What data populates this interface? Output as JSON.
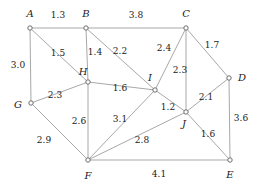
{
  "figure": {
    "type": "weighted-undirected-graph",
    "background_color": "#ffffff",
    "edge_color": "#a8a8a8",
    "node_stroke_color": "#6e6e6e",
    "node_fill_color": "#ffffff",
    "label_color": "#1a1a1a",
    "width": 259,
    "height": 191
  },
  "nodes": [
    {
      "id": "A",
      "label": "A",
      "x": 30,
      "y": 28,
      "label_x": 30,
      "label_y": 14
    },
    {
      "id": "B",
      "label": "B",
      "x": 86,
      "y": 28,
      "label_x": 86,
      "label_y": 14
    },
    {
      "id": "C",
      "label": "C",
      "x": 186,
      "y": 28,
      "label_x": 186,
      "label_y": 14
    },
    {
      "id": "D",
      "label": "D",
      "x": 229,
      "y": 78,
      "label_x": 242,
      "label_y": 78
    },
    {
      "id": "E",
      "label": "E",
      "x": 230,
      "y": 160,
      "label_x": 230,
      "label_y": 175
    },
    {
      "id": "F",
      "label": "F",
      "x": 88,
      "y": 160,
      "label_x": 88,
      "label_y": 176
    },
    {
      "id": "G",
      "label": "G",
      "x": 31,
      "y": 103,
      "label_x": 18,
      "label_y": 105
    },
    {
      "id": "H",
      "label": "H",
      "x": 88,
      "y": 82,
      "label_x": 83,
      "label_y": 72
    },
    {
      "id": "I",
      "label": "I",
      "x": 155,
      "y": 90,
      "label_x": 150,
      "label_y": 78
    },
    {
      "id": "J",
      "label": "J",
      "x": 186,
      "y": 112,
      "label_x": 184,
      "label_y": 124
    }
  ],
  "edges": [
    {
      "from": "A",
      "to": "B",
      "weight": "1.3",
      "label_x": 58,
      "label_y": 15
    },
    {
      "from": "B",
      "to": "C",
      "weight": "3.8",
      "label_x": 136,
      "label_y": 15
    },
    {
      "from": "A",
      "to": "G",
      "weight": "3.0",
      "label_x": 18,
      "label_y": 65
    },
    {
      "from": "A",
      "to": "H",
      "weight": "1.5",
      "label_x": 58,
      "label_y": 53
    },
    {
      "from": "B",
      "to": "H",
      "weight": "1.4",
      "label_x": 95,
      "label_y": 52
    },
    {
      "from": "B",
      "to": "I",
      "weight": "2.2",
      "label_x": 120,
      "label_y": 51
    },
    {
      "from": "C",
      "to": "I",
      "weight": "2.4",
      "label_x": 164,
      "label_y": 48
    },
    {
      "from": "C",
      "to": "D",
      "weight": "1.7",
      "label_x": 212,
      "label_y": 45
    },
    {
      "from": "C",
      "to": "J",
      "weight": "2.3",
      "label_x": 180,
      "label_y": 70
    },
    {
      "from": "G",
      "to": "H",
      "weight": "2.3",
      "label_x": 55,
      "label_y": 95
    },
    {
      "from": "H",
      "to": "I",
      "weight": "1.6",
      "label_x": 120,
      "label_y": 88
    },
    {
      "from": "I",
      "to": "J",
      "weight": "1.2",
      "label_x": 168,
      "label_y": 107
    },
    {
      "from": "D",
      "to": "J",
      "weight": "2.1",
      "label_x": 206,
      "label_y": 97
    },
    {
      "from": "D",
      "to": "E",
      "weight": "3.6",
      "label_x": 241,
      "label_y": 118
    },
    {
      "from": "J",
      "to": "E",
      "weight": "1.6",
      "label_x": 208,
      "label_y": 134
    },
    {
      "from": "H",
      "to": "F",
      "weight": "2.6",
      "label_x": 79,
      "label_y": 121
    },
    {
      "from": "G",
      "to": "F",
      "weight": "2.9",
      "label_x": 44,
      "label_y": 140
    },
    {
      "from": "I",
      "to": "F",
      "weight": "3.1",
      "label_x": 120,
      "label_y": 119
    },
    {
      "from": "J",
      "to": "F",
      "weight": "2.8",
      "label_x": 142,
      "label_y": 140
    },
    {
      "from": "F",
      "to": "E",
      "weight": "4.1",
      "label_x": 159,
      "label_y": 174
    }
  ]
}
